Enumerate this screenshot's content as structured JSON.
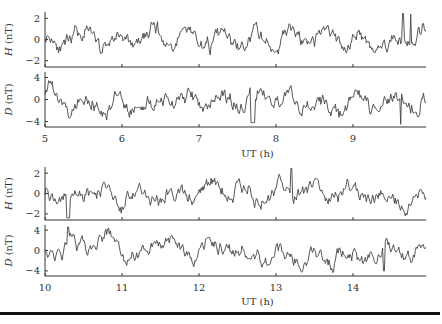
{
  "chart_data": [
    {
      "type": "line",
      "title": "",
      "xlabel": "UT (h)",
      "xlim": [
        5,
        10
      ],
      "x_ticks": [
        5,
        6,
        7,
        8,
        9
      ],
      "panels": [
        {
          "ylabel": "H (nT)",
          "ylim": [
            -2.6,
            2.6
          ],
          "y_ticks": [
            2,
            0,
            -2
          ],
          "features": "noisy oscillation roughly ±1.5 nT; spikes near 9.6–9.8 h up to ~2.5 nT"
        },
        {
          "ylabel": "D (nT)",
          "ylim": [
            -5,
            5
          ],
          "y_ticks": [
            4,
            0,
            -4
          ],
          "features": "oscillations ±3 nT; large dip near 7.7 h (~-4); sharp spike near 9.6 h (~-4)"
        }
      ],
      "seed": 11
    },
    {
      "type": "line",
      "title": "",
      "xlabel": "UT (h)",
      "xlim": [
        10,
        15
      ],
      "x_ticks": [
        10,
        11,
        12,
        13,
        14
      ],
      "panels": [
        {
          "ylabel": "H (nT)",
          "ylim": [
            -2.6,
            2.6
          ],
          "y_ticks": [
            2,
            0,
            -2
          ],
          "features": "noisy oscillation ±1.5 nT; deep dip near 10.3 h (~-3); peak near 13.2 h (~2.5)"
        },
        {
          "ylabel": "D (nT)",
          "ylim": [
            -5,
            5
          ],
          "y_ticks": [
            4,
            0,
            -4
          ],
          "features": "oscillations ±3 nT; spike near 10.3 h (~4.5); dips near 13.1, 14.0, 14.4 h"
        }
      ],
      "seed": 37
    }
  ],
  "labels": {
    "h_axis": "H (nT)",
    "d_axis": "D (nT)",
    "x_axis": "UT (h)"
  }
}
